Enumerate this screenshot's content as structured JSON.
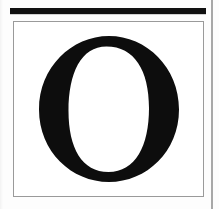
{
  "page": {
    "kind": "scanned-book-page",
    "background_color": "#ffffff",
    "width": 219,
    "height": 209
  },
  "top_rule": {
    "name": "top-rule",
    "color": "#111111",
    "thickness_px": 6,
    "left_px": 10,
    "right_px": 206
  },
  "specimen_frame": {
    "name": "specimen-frame",
    "border_color": "#9a9a9a",
    "border_width_px": 1.5,
    "fill_color": "#ffffff",
    "left_px": 13,
    "top_px": 21,
    "width_px": 191,
    "height_px": 176
  },
  "specimen_letter": {
    "character": "O",
    "case": "uppercase",
    "style": "serif",
    "ink_color": "#0d0d0d",
    "counter_color": "#ffffff",
    "stress": "slightly-inclined",
    "description": "Large serif capital letter O with thick left and right strokes and thin top and bottom strokes"
  },
  "right_margin_rule": {
    "name": "right-margin-rule",
    "color": "#a8a8a8",
    "thickness_px": 1.5,
    "left_px": 211
  },
  "accessibility": {
    "page_label": "Scanned page showing a single large serif capital letter O framed by a thin rectangle beneath a thick black rule"
  }
}
